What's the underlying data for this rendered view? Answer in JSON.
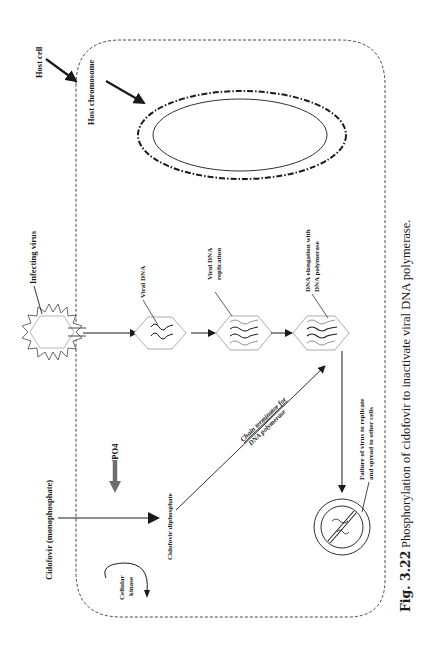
{
  "figure": {
    "orientation": "rotated 90deg counter-clockwise",
    "caption": {
      "number": "Fig. 3.22",
      "text": "Phosphorylation of cidofovir to inactivate viral DNA polymerase."
    },
    "labels": {
      "host_cell": "Host cell",
      "host_chromosome": "Host chromosome",
      "infecting_virus": "Infecting virus",
      "viral_dna": "Viral DNA",
      "viral_dna_replication_1": "Viral DNA",
      "viral_dna_replication_2": "replication",
      "dna_elongation_1": "DNA elongation with",
      "dna_elongation_2": "DNA polymerase",
      "cidofovir_mono": "Cidofovir (monophosphate)",
      "po4": "PO4",
      "po4_prefix": "'",
      "cidofovir_di": "Cidofovir diphosphate",
      "cellular_kinase_1": "Cellular",
      "cellular_kinase_2": "kinase",
      "chain_terminator_1": "Chain terminator for",
      "chain_terminator_2": "DNA polymerase",
      "failure_1": "Failure of virus to replicate",
      "failure_2": "and spread to other cells"
    },
    "colors": {
      "line": "#1a1a1a",
      "po4_arrow": "#6e6e6e",
      "shape_outline": "#8a8a8a",
      "background": "#ffffff"
    },
    "flow": [
      "Infecting virus",
      "Viral DNA",
      "Viral DNA replication",
      "DNA elongation with DNA polymerase",
      "Failure of virus to replicate and spread to other cells"
    ]
  }
}
